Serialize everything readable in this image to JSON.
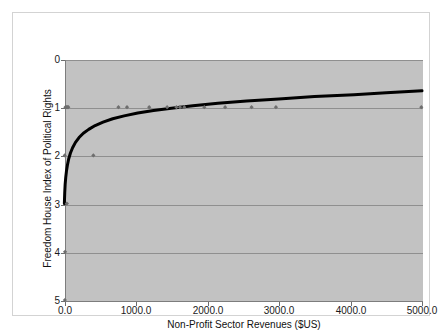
{
  "chart_data": {
    "type": "scatter",
    "title": "",
    "subtitle": "",
    "xlabel": "Non-Profit Sector Revenues ($US)",
    "ylabel": "Freedom House Index of Political Rights",
    "xlim": [
      0,
      5000
    ],
    "ylim": [
      0,
      5
    ],
    "y_axis_inverted": true,
    "grid": true,
    "legend": false,
    "legend_position": "none",
    "xticks": [
      0,
      1000,
      2000,
      3000,
      4000,
      5000
    ],
    "xtick_labels": [
      "0.0",
      "1000.0",
      "2000.0",
      "3000.0",
      "4000.0",
      "5000.0"
    ],
    "yticks": [
      0,
      1,
      2,
      3,
      4,
      5
    ],
    "ytick_labels": [
      "0",
      "1",
      "2",
      "3",
      "4",
      "5"
    ],
    "series": [
      {
        "name": "Observations",
        "type": "scatter",
        "marker": "diamond",
        "color": "#6e6e6e",
        "points": [
          [
            20,
            1
          ],
          [
            35,
            1
          ],
          [
            48,
            1
          ],
          [
            60,
            1
          ],
          [
            760,
            1
          ],
          [
            880,
            1
          ],
          [
            1190,
            1
          ],
          [
            1440,
            1
          ],
          [
            1570,
            1
          ],
          [
            1620,
            1
          ],
          [
            1680,
            1
          ],
          [
            1960,
            1
          ],
          [
            2250,
            1
          ],
          [
            2620,
            1
          ],
          [
            2960,
            1
          ],
          [
            4990,
            1
          ],
          [
            10,
            2
          ],
          [
            410,
            2
          ],
          [
            40,
            3
          ],
          [
            15,
            4
          ],
          [
            12,
            5
          ]
        ]
      },
      {
        "name": "Logarithmic fit",
        "type": "line",
        "color": "#000000",
        "line_width": 3,
        "equation_note": "rising logarithmic trend from y=3 near x=0 toward y=0.65 at x=5000",
        "points": [
          [
            5,
            3.0
          ],
          [
            10,
            2.78
          ],
          [
            16,
            2.6
          ],
          [
            24,
            2.46
          ],
          [
            34,
            2.33
          ],
          [
            48,
            2.2
          ],
          [
            66,
            2.07
          ],
          [
            90,
            1.95
          ],
          [
            120,
            1.84
          ],
          [
            160,
            1.73
          ],
          [
            210,
            1.63
          ],
          [
            270,
            1.54
          ],
          [
            345,
            1.46
          ],
          [
            435,
            1.38
          ],
          [
            545,
            1.31
          ],
          [
            680,
            1.24
          ],
          [
            840,
            1.18
          ],
          [
            1030,
            1.12
          ],
          [
            1250,
            1.07
          ],
          [
            1500,
            1.02
          ],
          [
            1800,
            0.97
          ],
          [
            2150,
            0.92
          ],
          [
            2550,
            0.87
          ],
          [
            3000,
            0.83
          ],
          [
            3500,
            0.78
          ],
          [
            4050,
            0.74
          ],
          [
            4500,
            0.7
          ],
          [
            5000,
            0.66
          ]
        ]
      }
    ]
  },
  "colors": {
    "plot_background": "#c2c2c2",
    "page_background": "#ffffff",
    "gridline": "#8f8f8f",
    "axis": "#7d7d7d",
    "marker": "#6e6e6e",
    "trend_line": "#000000",
    "frame_border": "#d3d3d3",
    "text": "#111111"
  }
}
